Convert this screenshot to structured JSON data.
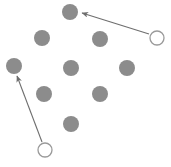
{
  "canvas": {
    "width": 171,
    "height": 167,
    "background_color": "#ffffff",
    "description": "Scatter diagram of nine filled gray dots with two open circles connected by arrows pointing toward dots"
  },
  "style": {
    "filled_dot_color": "#8c8c8c",
    "filled_dot_radius": 8,
    "open_circle_stroke_color": "#9a9a9a",
    "open_circle_fill": "#ffffff",
    "open_circle_radius": 7,
    "open_circle_stroke_width": 1.3,
    "arrow_color": "#6e6e6e",
    "arrow_stroke_width": 1.1
  },
  "filled_dots": [
    {
      "id": "dot-1",
      "label": "top-center dot",
      "cx": 70,
      "cy": 12
    },
    {
      "id": "dot-2",
      "label": "upper-left dot",
      "cx": 42,
      "cy": 38
    },
    {
      "id": "dot-3",
      "label": "upper-right dot",
      "cx": 100,
      "cy": 39
    },
    {
      "id": "dot-4",
      "label": "left-edge dot",
      "cx": 14,
      "cy": 66
    },
    {
      "id": "dot-5",
      "label": "center dot",
      "cx": 71,
      "cy": 68
    },
    {
      "id": "dot-6",
      "label": "right-edge dot",
      "cx": 127,
      "cy": 68
    },
    {
      "id": "dot-7",
      "label": "lower-left dot",
      "cx": 44,
      "cy": 94
    },
    {
      "id": "dot-8",
      "label": "lower-right dot",
      "cx": 100,
      "cy": 94
    },
    {
      "id": "dot-9",
      "label": "bottom-center dot",
      "cx": 71,
      "cy": 124
    }
  ],
  "open_circles": [
    {
      "id": "open-circle-1",
      "label": "top-right open circle",
      "cx": 157,
      "cy": 38
    },
    {
      "id": "open-circle-2",
      "label": "bottom-left open circle",
      "cx": 45,
      "cy": 150
    }
  ],
  "arrows": [
    {
      "id": "arrow-1",
      "label": "arrow from top-right open circle to top-center dot",
      "x1": 149,
      "y1": 34,
      "x2": 82,
      "y2": 13
    },
    {
      "id": "arrow-2",
      "label": "arrow from bottom-left open circle to left-edge dot",
      "x1": 42,
      "y1": 142,
      "x2": 17,
      "y2": 76
    }
  ]
}
